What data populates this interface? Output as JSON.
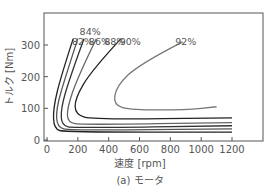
{
  "chart_data": {
    "type": "line",
    "title": "",
    "caption": "(a) モータ",
    "xlabel": "速度 [rpm]",
    "ylabel": "トルク [Nm]",
    "xlim": [
      0,
      1400
    ],
    "ylim": [
      0,
      380
    ],
    "x_ticks": [
      "0",
      "200",
      "400",
      "600",
      "800",
      "1000",
      "1200"
    ],
    "y_ticks": [
      "0",
      "100",
      "200",
      "300"
    ],
    "grid": false,
    "legend": "none",
    "series": [
      {
        "name": "82%",
        "label_x": 230,
        "label_y": 310,
        "points": [
          [
            170,
            320
          ],
          [
            90,
            200
          ],
          [
            40,
            100
          ],
          [
            45,
            35
          ],
          [
            120,
            25
          ],
          [
            1200,
            25
          ]
        ]
      },
      {
        "name": "84%",
        "label_x": 280,
        "label_y": 340,
        "points": [
          [
            200,
            320
          ],
          [
            120,
            200
          ],
          [
            60,
            100
          ],
          [
            65,
            40
          ],
          [
            150,
            30
          ],
          [
            1200,
            35
          ]
        ]
      },
      {
        "name": "86%",
        "label_x": 340,
        "label_y": 310,
        "points": [
          [
            240,
            320
          ],
          [
            150,
            200
          ],
          [
            90,
            100
          ],
          [
            95,
            45
          ],
          [
            180,
            38
          ],
          [
            1200,
            45
          ]
        ]
      },
      {
        "name": "88%",
        "label_x": 440,
        "label_y": 310,
        "points": [
          [
            320,
            320
          ],
          [
            200,
            200
          ],
          [
            130,
            100
          ],
          [
            135,
            55
          ],
          [
            230,
            48
          ],
          [
            1200,
            55
          ]
        ]
      },
      {
        "name": "90%",
        "label_x": 540,
        "label_y": 310,
        "points": [
          [
            480,
            320
          ],
          [
            290,
            220
          ],
          [
            180,
            130
          ],
          [
            185,
            80
          ],
          [
            300,
            65
          ],
          [
            1200,
            70
          ]
        ]
      },
      {
        "name": "92%",
        "label_x": 900,
        "label_y": 310,
        "points": [
          [
            880,
            310
          ],
          [
            600,
            240
          ],
          [
            450,
            170
          ],
          [
            430,
            110
          ],
          [
            550,
            95
          ],
          [
            900,
            95
          ],
          [
            1100,
            105
          ]
        ]
      }
    ]
  }
}
